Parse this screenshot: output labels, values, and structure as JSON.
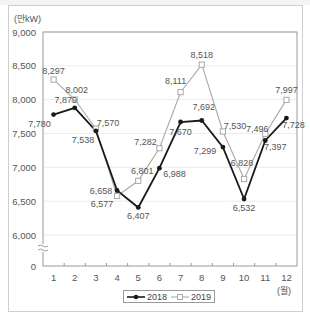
{
  "chart_data": {
    "type": "line",
    "title": "",
    "xlabel": "(월)",
    "ylabel": "(만kW)",
    "categories": [
      "1",
      "2",
      "3",
      "4",
      "5",
      "6",
      "7",
      "8",
      "9",
      "10",
      "11",
      "12"
    ],
    "x": [
      1,
      2,
      3,
      4,
      5,
      6,
      7,
      8,
      9,
      10,
      11,
      12
    ],
    "series": [
      {
        "name": "2018",
        "marker": "filled-circle",
        "color": "#1a1a1a",
        "values": [
          7780,
          7879,
          7538,
          6658,
          6407,
          6988,
          7670,
          7692,
          7299,
          6532,
          7397,
          7728
        ]
      },
      {
        "name": "2019",
        "marker": "hollow-square",
        "color": "#a8a8a8",
        "values": [
          8297,
          8002,
          7570,
          6577,
          6801,
          7282,
          8111,
          8518,
          7530,
          6828,
          7496,
          7997
        ]
      }
    ],
    "yticks": [
      "9,000",
      "8,500",
      "8,000",
      "7,500",
      "7,000",
      "6,500",
      "6,000",
      "0"
    ],
    "ylim": [
      0,
      9000
    ],
    "axis_break": "between 0 and 6,000",
    "grid": true,
    "legend_position": "bottom-center"
  },
  "labels": {
    "y_unit": "(만kW)",
    "x_unit": "(월)",
    "legend_2018": "2018",
    "legend_2019": "2019"
  }
}
